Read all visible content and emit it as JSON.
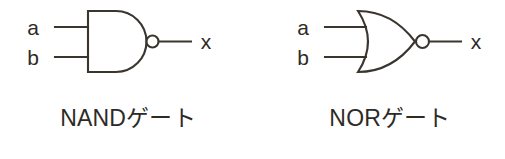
{
  "figure": {
    "background_color": "#ffffff",
    "stroke_color": "#3a352f",
    "text_color": "#2e2a26",
    "width": 505,
    "height": 159
  },
  "gates": [
    {
      "id": "nand",
      "caption": "NANDゲート",
      "symbol_name": "nand-gate-symbol",
      "shape": "and-body-with-inversion-bubble",
      "inputs": [
        {
          "label": "a"
        },
        {
          "label": "b"
        }
      ],
      "output": {
        "label": "x"
      },
      "bubble": {
        "present": true,
        "radius": 6
      }
    },
    {
      "id": "nor",
      "caption": "NORゲート",
      "symbol_name": "nor-gate-symbol",
      "shape": "or-body-with-inversion-bubble",
      "inputs": [
        {
          "label": "a"
        },
        {
          "label": "b"
        }
      ],
      "output": {
        "label": "x"
      },
      "bubble": {
        "present": true,
        "radius": 6
      }
    }
  ]
}
